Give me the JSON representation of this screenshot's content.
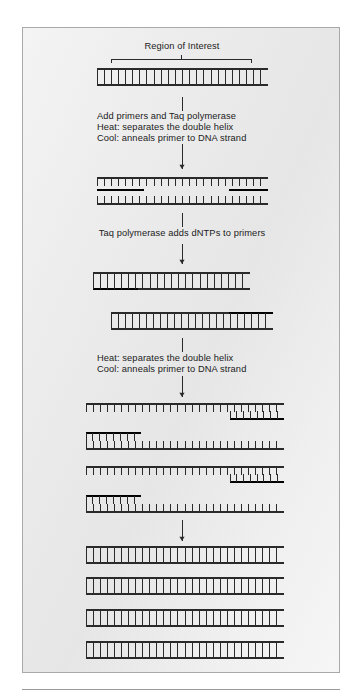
{
  "figure": {
    "panel": {
      "border_color": "#a9a9ab",
      "background": "#ececec"
    },
    "ink_color": "#2a2a2a",
    "bold_ink_color": "#000000"
  },
  "labels": {
    "region_of_interest": "Region of Interest",
    "step1_line1": "Add primers and Taq polymerase",
    "step1_line2": "Heat: separates the double helix",
    "step1_line3": "Cool: anneals primer to DNA strand",
    "step2_line1": "Taq polymerase adds dNTPs to primers",
    "step3_line1": "Heat: separates the double helix",
    "step3_line2": "Cool: anneals primer to DNA strand"
  },
  "stages": [
    {
      "name": "stage-1-template-duplex",
      "caption": "Region of Interest",
      "strands": [
        {
          "id": "s1-top",
          "x1": 96,
          "x2": 267,
          "y": 68,
          "ticks": "down",
          "bold_from": null,
          "bold_to": null
        },
        {
          "id": "s1-bottom",
          "x1": 96,
          "x2": 267,
          "y": 84,
          "ticks": "up",
          "bold_from": null,
          "bold_to": null
        }
      ],
      "bracket": {
        "x1": 110,
        "x2": 250,
        "y": 58,
        "label": "Region of Interest"
      }
    },
    {
      "name": "stage-2-denatured-primed",
      "strands": [
        {
          "id": "s2-top",
          "x1": 96,
          "x2": 267,
          "y": 177,
          "ticks": "down"
        },
        {
          "id": "s2-primer-l",
          "x1": 96,
          "x2": 143,
          "y": 189,
          "ticks": "none",
          "bold": true
        },
        {
          "id": "s2-primer-r",
          "x1": 228,
          "x2": 267,
          "y": 189,
          "ticks": "none",
          "bold": true
        },
        {
          "id": "s2-bottom",
          "x1": 96,
          "x2": 267,
          "y": 203,
          "ticks": "up"
        }
      ]
    },
    {
      "name": "stage-3-extended-duplexes",
      "strands": [
        {
          "id": "s3a-top",
          "x1": 92,
          "x2": 249,
          "y": 272,
          "ticks": "down"
        },
        {
          "id": "s3a-bottom",
          "x1": 92,
          "x2": 249,
          "y": 288,
          "ticks": "up",
          "bold_from": 92,
          "bold_to": 137
        },
        {
          "id": "s3b-top",
          "x1": 110,
          "x2": 272,
          "y": 312,
          "ticks": "down",
          "bold_from": 228,
          "bold_to": 272
        },
        {
          "id": "s3b-bottom",
          "x1": 110,
          "x2": 272,
          "y": 328,
          "ticks": "up"
        }
      ]
    },
    {
      "name": "stage-4-four-primed-strands",
      "strands": [
        {
          "id": "s4-1-top",
          "x1": 85,
          "x2": 283,
          "y": 403,
          "ticks": "down"
        },
        {
          "id": "s4-1-primer",
          "x1": 229,
          "x2": 283,
          "y": 418,
          "ticks": "up",
          "bold": true
        },
        {
          "id": "s4-2-primer",
          "x1": 85,
          "x2": 140,
          "y": 432,
          "ticks": "down",
          "bold": true
        },
        {
          "id": "s4-2-bottom",
          "x1": 85,
          "x2": 283,
          "y": 448,
          "ticks": "up"
        },
        {
          "id": "s4-3-top",
          "x1": 85,
          "x2": 283,
          "y": 466,
          "ticks": "down"
        },
        {
          "id": "s4-3-primer",
          "x1": 229,
          "x2": 283,
          "y": 481,
          "ticks": "up",
          "bold": true
        },
        {
          "id": "s4-4-primer",
          "x1": 85,
          "x2": 140,
          "y": 495,
          "ticks": "down",
          "bold": true
        },
        {
          "id": "s4-4-bottom",
          "x1": 85,
          "x2": 283,
          "y": 511,
          "ticks": "up"
        }
      ]
    },
    {
      "name": "stage-5-four-duplexes",
      "strands": [
        {
          "id": "s5-1-top",
          "x1": 85,
          "x2": 283,
          "y": 546,
          "ticks": "down"
        },
        {
          "id": "s5-1-bottom",
          "x1": 85,
          "x2": 283,
          "y": 562,
          "ticks": "up"
        },
        {
          "id": "s5-2-top",
          "x1": 85,
          "x2": 283,
          "y": 577,
          "ticks": "down"
        },
        {
          "id": "s5-2-bottom",
          "x1": 85,
          "x2": 283,
          "y": 593,
          "ticks": "up"
        },
        {
          "id": "s5-3-top",
          "x1": 85,
          "x2": 283,
          "y": 609,
          "ticks": "down"
        },
        {
          "id": "s5-3-bottom",
          "x1": 85,
          "x2": 283,
          "y": 625,
          "ticks": "up"
        },
        {
          "id": "s5-4-top",
          "x1": 85,
          "x2": 283,
          "y": 641,
          "ticks": "down"
        },
        {
          "id": "s5-4-bottom",
          "x1": 85,
          "x2": 283,
          "y": 657,
          "ticks": "up"
        }
      ]
    }
  ],
  "connectors": [
    {
      "id": "c1-plain",
      "x": 181,
      "y1": 96,
      "y2": 110,
      "arrow": false
    },
    {
      "id": "c1-arrow",
      "x": 181,
      "y1": 143,
      "y2": 168,
      "arrow": true
    },
    {
      "id": "c2-plain",
      "x": 181,
      "y1": 212,
      "y2": 226,
      "arrow": false
    },
    {
      "id": "c2-arrow",
      "x": 181,
      "y1": 243,
      "y2": 263,
      "arrow": true
    },
    {
      "id": "c3-plain",
      "x": 181,
      "y1": 337,
      "y2": 351,
      "arrow": false
    },
    {
      "id": "c3-arrow",
      "x": 181,
      "y1": 375,
      "y2": 396,
      "arrow": true
    },
    {
      "id": "c4-arrow",
      "x": 181,
      "y1": 519,
      "y2": 540,
      "arrow": true
    }
  ],
  "captions": [
    {
      "id": "cap-region",
      "text": "Region of Interest",
      "x": 181,
      "y": 40,
      "align": "center"
    },
    {
      "id": "cap-step1-1",
      "text": "Add primers and Taq polymerase",
      "x": 96,
      "y": 110,
      "align": "left"
    },
    {
      "id": "cap-step1-2",
      "text": "Heat: separates the double helix",
      "x": 96,
      "y": 121,
      "align": "left"
    },
    {
      "id": "cap-step1-3",
      "text": "Cool: anneals primer to DNA strand",
      "x": 96,
      "y": 132,
      "align": "left"
    },
    {
      "id": "cap-step2-1",
      "text": "Taq polymerase adds dNTPs to primers",
      "x": 181,
      "y": 227,
      "align": "center"
    },
    {
      "id": "cap-step3-1",
      "text": "Heat: separates the double helix",
      "x": 96,
      "y": 352,
      "align": "left"
    },
    {
      "id": "cap-step3-2",
      "text": "Cool: anneals primer to DNA strand",
      "x": 96,
      "y": 363,
      "align": "left"
    }
  ],
  "render": {
    "tick_spacing": 7.2,
    "tick_length": 8,
    "strand_width": 1.3,
    "bold_strand_width": 2.6
  }
}
